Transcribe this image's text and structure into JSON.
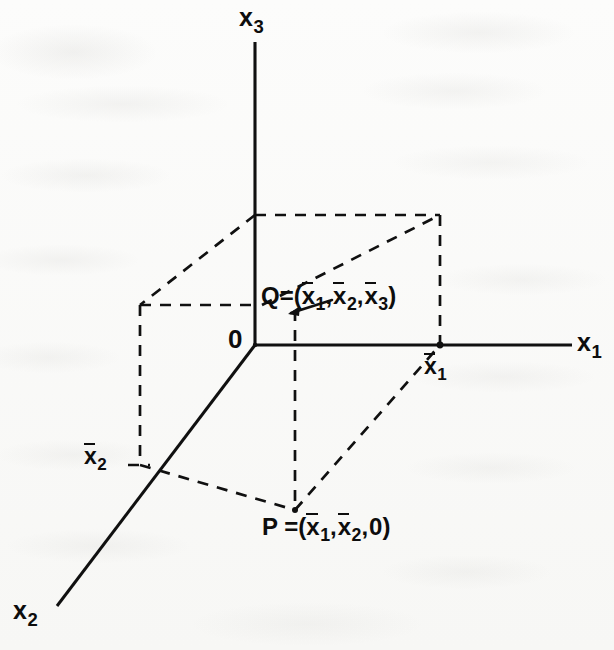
{
  "figure": {
    "kind": "3d-coordinate-axes-diagram",
    "background_color": "#fbfbfa",
    "ink_color": "#0d0d0d"
  },
  "axes": {
    "x1": {
      "label_base": "x",
      "label_sub": "1",
      "name": "x1-axis"
    },
    "x2": {
      "label_base": "x",
      "label_sub": "2",
      "name": "x2-axis"
    },
    "x3": {
      "label_base": "x",
      "label_sub": "3",
      "name": "x3-axis"
    }
  },
  "origin": {
    "label": "0"
  },
  "ticks": {
    "x1bar": {
      "base": "x",
      "sub": "1",
      "overbar": true
    },
    "x2bar": {
      "base": "x",
      "sub": "2",
      "overbar": true
    }
  },
  "points": {
    "Q": {
      "name": "Q",
      "equals": "=",
      "open": "(",
      "close": ")",
      "comma": ",",
      "coords": [
        {
          "base": "x",
          "sub": "1",
          "overbar": true
        },
        {
          "base": "x",
          "sub": "2",
          "overbar": true
        },
        {
          "base": "x",
          "sub": "3",
          "overbar": true
        }
      ]
    },
    "P": {
      "name": "P",
      "equals": "=",
      "open": "(",
      "close": ")",
      "comma": ",",
      "coords": [
        {
          "base": "x",
          "sub": "1",
          "overbar": true
        },
        {
          "base": "x",
          "sub": "2",
          "overbar": true
        },
        {
          "base": "0",
          "sub": "",
          "overbar": false
        }
      ]
    }
  },
  "geometry": {
    "origin_px": [
      255,
      345
    ],
    "x3_axis_top_px": [
      255,
      42
    ],
    "x1_axis_end_px": [
      572,
      345
    ],
    "x2_axis_end_px": [
      57,
      606
    ],
    "x1bar_px": [
      440,
      345
    ],
    "x2bar_px": [
      140,
      465
    ],
    "P_px": [
      295,
      510
    ],
    "Q_px": [
      255,
      305
    ],
    "box_top_back_left_px": [
      140,
      305
    ],
    "box_top_back_right_px": [
      440,
      215
    ],
    "box_top_front_left_px": [
      255,
      215
    ],
    "box_bottom_back_left_px": [
      140,
      465
    ]
  }
}
